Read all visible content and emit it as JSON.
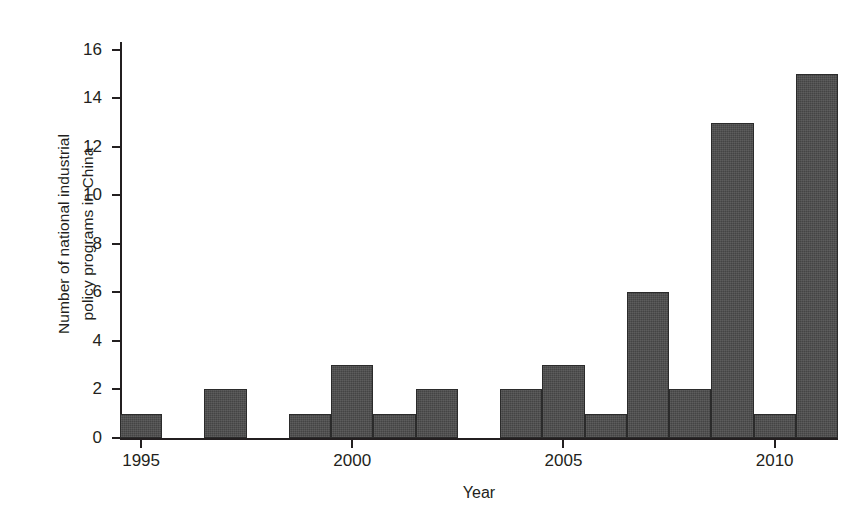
{
  "chart_data": {
    "type": "bar",
    "title": "",
    "xlabel": "Year",
    "ylabel": "Number of national industrial policy programs in China",
    "ylabel_line1": "Number of national industrial",
    "ylabel_line2": "policy programs in China",
    "categories": [
      1995,
      1996,
      1997,
      1998,
      1999,
      2000,
      2001,
      2002,
      2003,
      2004,
      2005,
      2006,
      2007,
      2008,
      2009,
      2010,
      2011
    ],
    "values": [
      1,
      0,
      2,
      0,
      1,
      3,
      1,
      2,
      0,
      2,
      3,
      1,
      6,
      2,
      13,
      1,
      15
    ],
    "xlim": [
      1994.5,
      2011.5
    ],
    "ylim": [
      0,
      16.4
    ],
    "yticks": [
      0,
      2,
      4,
      6,
      8,
      10,
      12,
      14,
      16
    ],
    "ytick_labels": [
      "0",
      "2",
      "4",
      "6",
      "8",
      "10",
      "12",
      "14",
      "16"
    ],
    "xticks": [
      1995,
      2000,
      2005,
      2010
    ],
    "xtick_labels": [
      "1995",
      "2000",
      "2005",
      "2010"
    ],
    "grid": false,
    "legend": null,
    "bar_color": "#4b4b4b",
    "bar_edge_color": "#2b2b2b",
    "axis_color": "#231f20",
    "background_color": "#ffffff"
  }
}
